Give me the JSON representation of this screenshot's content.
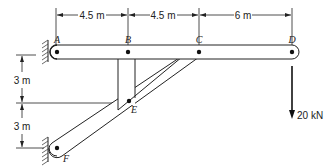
{
  "diagram": {
    "points": {
      "A": {
        "label": "A",
        "x": 57,
        "y": 52
      },
      "B": {
        "label": "B",
        "x": 128,
        "y": 52
      },
      "C": {
        "label": "C",
        "x": 199,
        "y": 52
      },
      "D": {
        "label": "D",
        "x": 292,
        "y": 52
      },
      "E": {
        "label": "E",
        "x": 129,
        "y": 101
      },
      "F": {
        "label": "F",
        "x": 57,
        "y": 148
      }
    },
    "horizontal_dimensions": [
      {
        "label": "4.5 m",
        "from": "A",
        "to": "B"
      },
      {
        "label": "4.5 m",
        "from": "B",
        "to": "C"
      },
      {
        "label": "6 m",
        "from": "C",
        "to": "D"
      }
    ],
    "vertical_dimensions": [
      {
        "label": "3 m",
        "from": "A-level",
        "to": "E-level"
      },
      {
        "label": "3 m",
        "from": "E-level",
        "to": "F-level"
      }
    ],
    "load": {
      "label": "20 kN",
      "at": "D",
      "direction": "down"
    },
    "colors": {
      "line": "#222222",
      "member_fill": "#ffffff",
      "hatch": "#444444"
    }
  }
}
